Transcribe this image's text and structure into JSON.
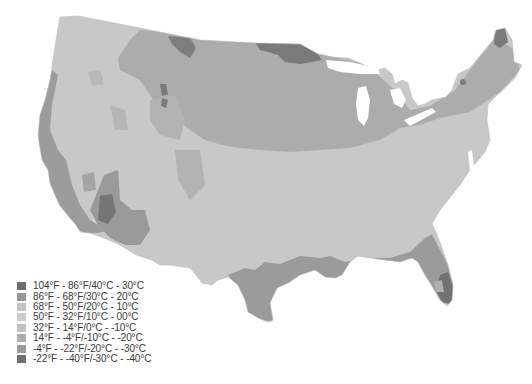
{
  "map": {
    "subject": "Contiguous United States temperature zones",
    "style": "grayscale choropleth"
  },
  "legend": {
    "items": [
      {
        "label": "104°F - 86°F/40°C - 30°C",
        "color": "#6e6e6e"
      },
      {
        "label": "86°F - 68°F/30°C - 20°C",
        "color": "#979797"
      },
      {
        "label": "68°F - 50°F/20°C - 10°C",
        "color": "#c4c4c4"
      },
      {
        "label": "50°F - 32°F/10°C - 00°C",
        "color": "#cdcdcd"
      },
      {
        "label": "32°F - 14°F/0°C - -10°C",
        "color": "#c2c2c2"
      },
      {
        "label": "14°F - -4°F/-10°C - -20°C",
        "color": "#aeaeae"
      },
      {
        "label": "-4°F - -22°F/-20°C - -30°C",
        "color": "#9a9a9a"
      },
      {
        "label": "-22°F - -40°F/-30°C - -40°C",
        "color": "#6f6f6f"
      }
    ]
  },
  "colors": {
    "base": "#c7c7c7",
    "north": "#aaaaaa",
    "cold": "#727272",
    "coast": "#969696",
    "hot": "#6c6c6c",
    "background": "#ffffff"
  }
}
